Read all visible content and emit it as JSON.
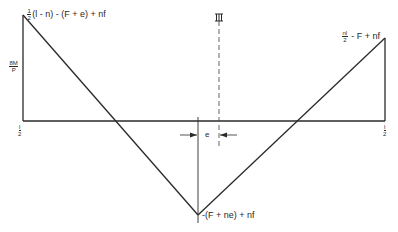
{
  "diagram": {
    "type": "bending-moment-diagram",
    "colors": {
      "line": "#2a2a2a",
      "background": "#ffffff"
    },
    "labels": {
      "top_left": {
        "frac_num": "1",
        "frac_den": "2",
        "text": "(l - n) - (F + e) + nf"
      },
      "top_right": {
        "frac_num": "nl",
        "frac_den": "2",
        "text": " - F + nf"
      },
      "bottom": {
        "text": "-(F + ne) + nf"
      },
      "y_axis": {
        "frac_num": "8M",
        "frac_den": "P"
      },
      "left_end": {
        "frac_num": "l",
        "frac_den": "2"
      },
      "right_end": {
        "frac_num": "l",
        "frac_den": "2"
      },
      "eccentricity": {
        "text": "e"
      },
      "centerline_mark": {
        "text": "Ⅲ"
      }
    },
    "geometry": {
      "baseline_y": 121,
      "left_x": 23,
      "right_x": 385,
      "left_peak_y": 15,
      "right_peak_y": 38,
      "bottom_vertex": [
        198,
        215
      ],
      "centerline_x": 219
    }
  }
}
